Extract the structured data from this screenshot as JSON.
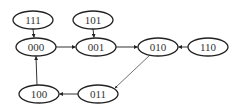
{
  "diagram": {
    "type": "state-transition-graph",
    "stroke_color": "#222222",
    "text_color": "#333333",
    "nodes": [
      {
        "id": "111",
        "label": "111",
        "cx": 33,
        "cy": 20
      },
      {
        "id": "101",
        "label": "101",
        "cx": 93,
        "cy": 20
      },
      {
        "id": "000",
        "label": "000",
        "cx": 36,
        "cy": 47
      },
      {
        "id": "001",
        "label": "001",
        "cx": 96,
        "cy": 47
      },
      {
        "id": "010",
        "label": "010",
        "cx": 158,
        "cy": 47
      },
      {
        "id": "110",
        "label": "110",
        "cx": 208,
        "cy": 47
      },
      {
        "id": "100",
        "label": "100",
        "cx": 39,
        "cy": 94
      },
      {
        "id": "011",
        "label": "011",
        "cx": 98,
        "cy": 94
      }
    ],
    "edges": [
      {
        "from": "111",
        "to": "000"
      },
      {
        "from": "101",
        "to": "001"
      },
      {
        "from": "000",
        "to": "001"
      },
      {
        "from": "001",
        "to": "010"
      },
      {
        "from": "110",
        "to": "010"
      },
      {
        "from": "010",
        "to": "011"
      },
      {
        "from": "011",
        "to": "100"
      },
      {
        "from": "100",
        "to": "000"
      }
    ]
  }
}
